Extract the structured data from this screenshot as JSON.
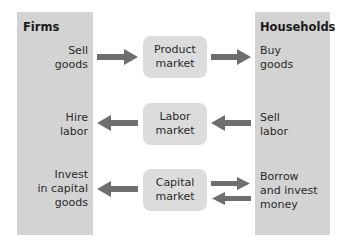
{
  "firms": {
    "title": "Firms",
    "rows": [
      "Sell\ngoods",
      "Hire\nlabor",
      "Invest\nin capital\ngoods"
    ]
  },
  "households": {
    "title": "Households",
    "rows": [
      "Buy\ngoods",
      "Sell\nlabor",
      "Borrow\nand invest\nmoney"
    ]
  },
  "markets": [
    {
      "label": "Product\nmarket",
      "left_arrow": "right",
      "right_arrow": "right"
    },
    {
      "label": "Labor\nmarket",
      "left_arrow": "left",
      "right_arrow": "left"
    },
    {
      "label": "Capital\nmarket",
      "left_arrow": "left",
      "right_arrow": "both"
    }
  ],
  "colors": {
    "panel": "#d3d3d3",
    "market_box": "#dcdcdc",
    "arrow": "#6e6e6e"
  }
}
